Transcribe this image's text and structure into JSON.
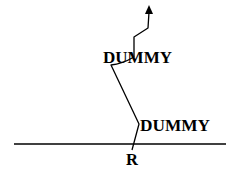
{
  "diagram": {
    "labels": {
      "upper_node": "DUMMY",
      "lower_node": "DUMMY",
      "root": "R"
    },
    "colors": {
      "stroke": "#000000",
      "background": "#ffffff"
    }
  }
}
